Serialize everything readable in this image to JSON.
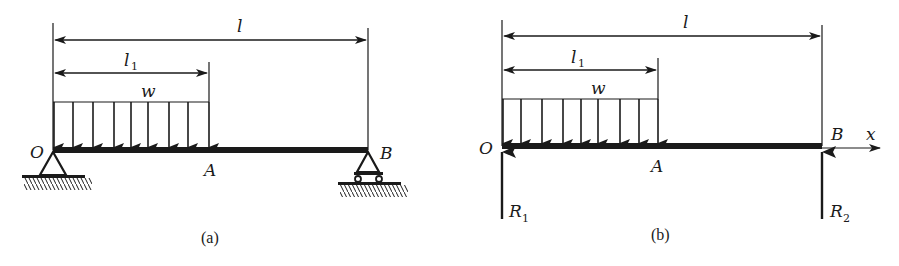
{
  "figure_a": {
    "caption": "(a)",
    "labels": {
      "span": "l",
      "partial_span": "l",
      "partial_span_sub": "1",
      "load": "w",
      "left_end": "O",
      "load_end": "A",
      "right_end": "B"
    },
    "supports": {
      "left": "pin-support",
      "right": "roller-support"
    },
    "load_arrow_count": 9
  },
  "figure_b": {
    "caption": "(b)",
    "labels": {
      "span": "l",
      "partial_span": "l",
      "partial_span_sub": "1",
      "load": "w",
      "left_end": "O",
      "load_end": "A",
      "right_end": "B",
      "axis": "x",
      "reaction_left": "R",
      "reaction_left_sub": "1",
      "reaction_right": "R",
      "reaction_right_sub": "2"
    },
    "load_arrow_count": 9
  },
  "colors": {
    "ink": "#1a1a1a",
    "background": "#ffffff"
  }
}
